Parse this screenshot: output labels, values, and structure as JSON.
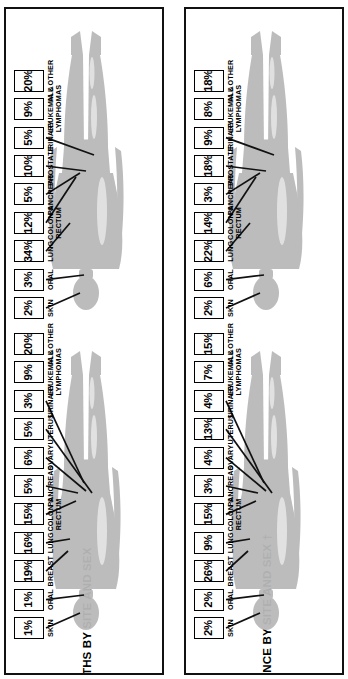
{
  "page": {
    "background": "#ffffff",
    "ink": "#000000",
    "silhouette_fill": "#b9b9b9"
  },
  "panels": [
    {
      "id": "deaths",
      "title": "CANCER DEATHS BY SITE AND SEX",
      "groups": [
        {
          "id": "female-deaths",
          "sex": "female",
          "figure_name": "female-body-silhouette",
          "items": [
            {
              "site": "SKIN",
              "pct": "1%"
            },
            {
              "site": "ORAL",
              "pct": "1%"
            },
            {
              "site": "BREAST",
              "pct": "19%"
            },
            {
              "site": "LUNG",
              "pct": "16%"
            },
            {
              "site": "COLON &\nRECTUM",
              "pct": "15%"
            },
            {
              "site": "PANCREAS",
              "pct": "5%"
            },
            {
              "site": "OVARY",
              "pct": "6%"
            },
            {
              "site": "UTERUS",
              "pct": "5%"
            },
            {
              "site": "URINARY",
              "pct": "3%"
            },
            {
              "site": "LEUKEMIA &\nLYMPHOMAS",
              "pct": "9%"
            },
            {
              "site": "ALL OTHER",
              "pct": "20%"
            }
          ]
        },
        {
          "id": "male-deaths",
          "sex": "male",
          "figure_name": "male-body-silhouette",
          "items": [
            {
              "site": "SKIN",
              "pct": "2%"
            },
            {
              "site": "ORAL",
              "pct": "3%"
            },
            {
              "site": "LUNG",
              "pct": "34%"
            },
            {
              "site": "COLON &\nRECTUM",
              "pct": "12%"
            },
            {
              "site": "PANCREAS",
              "pct": "5%"
            },
            {
              "site": "PROSTATE",
              "pct": "10%"
            },
            {
              "site": "URINARY",
              "pct": "5%"
            },
            {
              "site": "LEUKEMIA &\nLYMPHOMAS",
              "pct": "9%"
            },
            {
              "site": "ALL OTHER",
              "pct": "20%"
            }
          ]
        }
      ]
    },
    {
      "id": "incidence",
      "title": "CANCER INCIDENCE BY SITE AND SEX †",
      "groups": [
        {
          "id": "female-incidence",
          "sex": "female",
          "figure_name": "female-body-silhouette",
          "items": [
            {
              "site": "SKIN",
              "pct": "2%"
            },
            {
              "site": "ORAL",
              "pct": "2%"
            },
            {
              "site": "BREAST",
              "pct": "26%"
            },
            {
              "site": "LUNG",
              "pct": "9%"
            },
            {
              "site": "COLON &\nRECTUM",
              "pct": "15%"
            },
            {
              "site": "PANCREAS",
              "pct": "3%"
            },
            {
              "site": "OVARY",
              "pct": "4%"
            },
            {
              "site": "UTERUS",
              "pct": "13%"
            },
            {
              "site": "URINARY",
              "pct": "4%"
            },
            {
              "site": "LEUKEMIA &\nLYMPHOMAS",
              "pct": "7%"
            },
            {
              "site": "ALL OTHER",
              "pct": "15%"
            }
          ]
        },
        {
          "id": "male-incidence",
          "sex": "male",
          "figure_name": "male-body-silhouette",
          "items": [
            {
              "site": "SKIN",
              "pct": "2%"
            },
            {
              "site": "ORAL",
              "pct": "6%"
            },
            {
              "site": "LUNG",
              "pct": "22%"
            },
            {
              "site": "COLON &\nRECTUM",
              "pct": "14%"
            },
            {
              "site": "PANCREAS",
              "pct": "3%"
            },
            {
              "site": "PROSTATE",
              "pct": "18%"
            },
            {
              "site": "URINARY",
              "pct": "9%"
            },
            {
              "site": "LEUKEMIA &\nLYMPHOMAS",
              "pct": "8%"
            },
            {
              "site": "ALL OTHER",
              "pct": "18%"
            }
          ]
        }
      ]
    }
  ],
  "chart_data": {
    "type": "bar",
    "xlabel": "Cancer site",
    "ylabel": "Percent of all cancers",
    "ylim": [
      0,
      40
    ],
    "grid": false,
    "legend": "none",
    "annotations": [
      "†"
    ],
    "charts": [
      {
        "title": "CANCER DEATHS BY SITE AND SEX",
        "subgroup": "female",
        "categories": [
          "SKIN",
          "ORAL",
          "BREAST",
          "LUNG",
          "COLON & RECTUM",
          "PANCREAS",
          "OVARY",
          "UTERUS",
          "URINARY",
          "LEUKEMIA & LYMPHOMAS",
          "ALL OTHER"
        ],
        "values": [
          1,
          1,
          19,
          16,
          15,
          5,
          6,
          5,
          3,
          9,
          20
        ]
      },
      {
        "title": "CANCER DEATHS BY SITE AND SEX",
        "subgroup": "male",
        "categories": [
          "SKIN",
          "ORAL",
          "LUNG",
          "COLON & RECTUM",
          "PANCREAS",
          "PROSTATE",
          "URINARY",
          "LEUKEMIA & LYMPHOMAS",
          "ALL OTHER"
        ],
        "values": [
          2,
          3,
          34,
          12,
          5,
          10,
          5,
          9,
          20
        ]
      },
      {
        "title": "CANCER INCIDENCE BY SITE AND SEX †",
        "subgroup": "female",
        "categories": [
          "SKIN",
          "ORAL",
          "BREAST",
          "LUNG",
          "COLON & RECTUM",
          "PANCREAS",
          "OVARY",
          "UTERUS",
          "URINARY",
          "LEUKEMIA & LYMPHOMAS",
          "ALL OTHER"
        ],
        "values": [
          2,
          2,
          26,
          9,
          15,
          3,
          4,
          13,
          4,
          7,
          15
        ]
      },
      {
        "title": "CANCER INCIDENCE BY SITE AND SEX †",
        "subgroup": "male",
        "categories": [
          "SKIN",
          "ORAL",
          "LUNG",
          "COLON & RECTUM",
          "PANCREAS",
          "PROSTATE",
          "URINARY",
          "LEUKEMIA & LYMPHOMAS",
          "ALL OTHER"
        ],
        "values": [
          2,
          6,
          22,
          14,
          3,
          18,
          9,
          8,
          18
        ]
      }
    ]
  }
}
